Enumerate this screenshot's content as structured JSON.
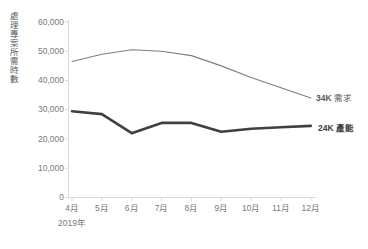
{
  "chart_data": {
    "type": "line",
    "title": "",
    "xlabel": "2019年",
    "ylabel": "處理專案所需時數",
    "categories": [
      "4月",
      "5月",
      "6月",
      "7月",
      "8月",
      "9月",
      "10月",
      "11月",
      "12月"
    ],
    "ylim": [
      0,
      60000
    ],
    "yticks": [
      0,
      10000,
      20000,
      30000,
      40000,
      50000,
      60000
    ],
    "ytick_labels": [
      "0",
      "10,000",
      "20,000",
      "30,000",
      "40,000",
      "50,000",
      "60,000"
    ],
    "grid": false,
    "legend_position": "right-inline",
    "series": [
      {
        "name": "需求",
        "end_label": "34K",
        "end_label_full": "34K 需求",
        "color": "#7f7f7f",
        "width": 1.1,
        "values": [
          46500,
          49000,
          50500,
          50000,
          48500,
          45000,
          41000,
          37500,
          34000
        ]
      },
      {
        "name": "產能",
        "end_label": "24K",
        "end_label_full": "24K 產能",
        "color": "#404040",
        "width": 2.6,
        "values": [
          29500,
          28500,
          22000,
          25500,
          25500,
          22500,
          23500,
          24000,
          24500
        ]
      }
    ],
    "axis_color": "#d9d9d9",
    "tick_color": "#7a7a7a"
  },
  "axis": {
    "year": "2019年",
    "ylabel": "處理專案所需時數"
  },
  "labels": {
    "demand_value": "34K",
    "demand_name": "需求",
    "capacity_value": "24K",
    "capacity_name": "產能"
  }
}
